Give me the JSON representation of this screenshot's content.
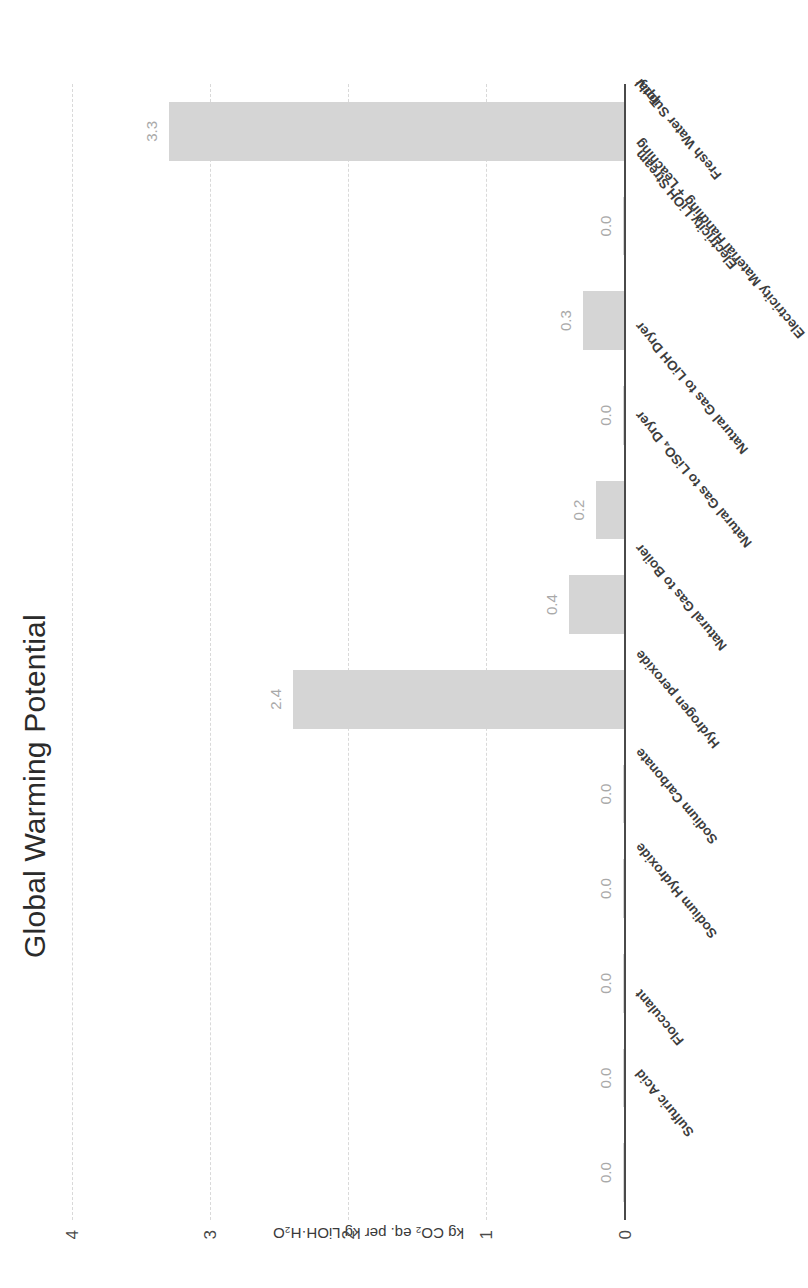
{
  "chart_data": {
    "type": "bar",
    "title": "Global Warming Potential",
    "xlabel": "",
    "ylabel": "kg CO₂ eq. per kg LiOH·H₂O",
    "orientation": "vertical-bars-rendered-sideways",
    "grid": true,
    "legend": null,
    "ylim": [
      0,
      4
    ],
    "yticks": [
      "0",
      "1",
      "2",
      "3",
      "4"
    ],
    "ytick_values": [
      0,
      1,
      2,
      3,
      4
    ],
    "categories": [
      "Sulfuric Acid",
      "Flocculant",
      "Sodium Hydroxide",
      "Sodium Carbonate",
      "Hydrogen peroxide",
      "Natural Gas to Boiler",
      "Natural Gas to LiSO₄ Dryer",
      "Natural Gas to LiOH Dryer",
      "Electricity Material Handling + Leaching",
      "Electricity LiOH Stream",
      "Fresh Water Supply",
      "Total"
    ],
    "values": [
      0.0,
      0.0,
      0.0,
      0.0,
      0.0,
      2.4,
      0.4,
      0.2,
      0.0,
      0.3,
      0.0,
      3.3
    ],
    "data_labels": [
      "0.0",
      "0.0",
      "0.0",
      "0.0",
      "0.0",
      "2.4",
      "0.4",
      "0.2",
      "0.0",
      "0.3",
      "0.0",
      "3.3"
    ],
    "colors": {
      "bar": "#d5d5d5",
      "grid": "#d9d9d9",
      "axis": "#4a4a4a",
      "label": "#a9a9a9",
      "title": "#2b2b2b",
      "background": "#ffffff"
    }
  }
}
